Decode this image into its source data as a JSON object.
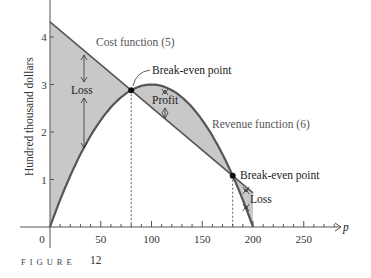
{
  "chart_data": {
    "type": "line",
    "title": "",
    "xlabel": "p",
    "ylabel": "Hundred thousand dollars",
    "xlim": [
      -15,
      285
    ],
    "ylim": [
      -0.6,
      4.8
    ],
    "x_ticks": [
      0,
      50,
      100,
      150,
      200,
      250
    ],
    "x_tick_labels": [
      "0",
      "50",
      "100",
      "150",
      "200",
      "250"
    ],
    "x_minor_step": 10,
    "y_ticks": [
      1,
      2,
      3,
      4
    ],
    "y_tick_labels": [
      "1",
      "2",
      "3",
      "4"
    ],
    "grid": false,
    "series": [
      {
        "name": "Cost function (5)",
        "formula": "C(p) = 4.32 - 0.018p",
        "x": [
          0,
          50,
          80,
          100,
          150,
          180,
          200
        ],
        "values": [
          4.32,
          3.42,
          2.88,
          2.52,
          1.62,
          1.08,
          0.72
        ]
      },
      {
        "name": "Revenue function (6)",
        "formula": "R(p) = 0.0003p(200 - p)",
        "x": [
          0,
          25,
          50,
          80,
          100,
          125,
          150,
          180,
          200
        ],
        "values": [
          0,
          1.31,
          2.25,
          2.88,
          3.0,
          2.81,
          2.25,
          1.08,
          0
        ]
      }
    ],
    "break_even_points": [
      {
        "p": 80,
        "value": 2.88,
        "label": "Break-even point"
      },
      {
        "p": 180,
        "value": 1.08,
        "label": "Break-even point"
      }
    ],
    "regions": [
      {
        "label": "Loss",
        "p_range": [
          0,
          80
        ]
      },
      {
        "label": "Profit",
        "p_range": [
          80,
          180
        ]
      },
      {
        "label": "Loss",
        "p_range": [
          180,
          200
        ]
      }
    ],
    "annotations": [
      "Cost function (5)",
      "Revenue function (6)",
      "Break-even point",
      "Break-even point",
      "Loss",
      "Profit",
      "Loss"
    ]
  },
  "labels": {
    "cost": "Cost function (5)",
    "revenue": "Revenue function (6)",
    "break_even_1": "Break-even point",
    "break_even_2": "Break-even point",
    "loss_1": "Loss",
    "profit": "Profit",
    "loss_2": "Loss",
    "ylabel": "Hundred thousand dollars",
    "xlabel": "p",
    "origin": "0"
  },
  "caption": {
    "word": "FIGURE",
    "number": "12"
  },
  "colors": {
    "fill": "#c8c8c8",
    "curve": "#555555",
    "axis": "#555555",
    "point": "#111111"
  }
}
